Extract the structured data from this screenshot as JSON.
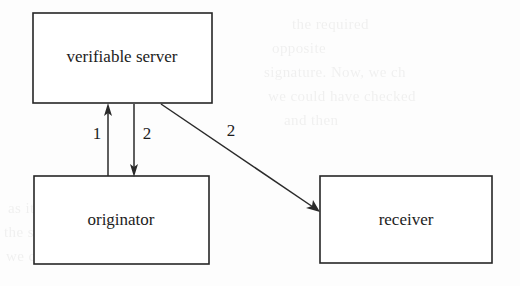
{
  "diagram": {
    "type": "node-edge-diagram",
    "canvas": {
      "width": 520,
      "height": 286
    },
    "colors": {
      "background": "#fdfdfd",
      "box_stroke": "#262626",
      "box_fill": "#ffffff",
      "text": "#1c1c1c",
      "edge": "#2a2a2a"
    },
    "nodes": [
      {
        "id": "verifiable-server",
        "label": "verifiable server",
        "x": 33,
        "y": 13,
        "width": 179,
        "height": 90,
        "label_x": 122,
        "label_y": 58
      },
      {
        "id": "originator",
        "label": "originator",
        "x": 34,
        "y": 176,
        "width": 175,
        "height": 88,
        "label_x": 121,
        "label_y": 221
      },
      {
        "id": "receiver",
        "label": "receiver",
        "x": 320,
        "y": 176,
        "width": 172,
        "height": 87,
        "label_x": 406,
        "label_y": 221
      }
    ],
    "edges": [
      {
        "id": "edge-originator-to-server",
        "label": "1",
        "from": "originator",
        "to": "verifiable-server",
        "direction": "up",
        "x1": 108,
        "y1": 176,
        "x2": 108,
        "y2": 104,
        "label_x": 97,
        "label_y": 135
      },
      {
        "id": "edge-server-to-originator",
        "label": "2",
        "from": "verifiable-server",
        "to": "originator",
        "direction": "down",
        "x1": 134,
        "y1": 104,
        "x2": 134,
        "y2": 176,
        "label_x": 147,
        "label_y": 135
      },
      {
        "id": "edge-server-to-receiver",
        "label": "2",
        "from": "verifiable-server",
        "to": "receiver",
        "direction": "diagonal-down-right",
        "x1": 161,
        "y1": 104,
        "x2": 319,
        "y2": 211,
        "label_x": 231,
        "label_y": 132
      }
    ],
    "background_bleed": [
      {
        "text": "the required",
        "x": 292,
        "y": 12
      },
      {
        "text": "opposite",
        "x": 272,
        "y": 36
      },
      {
        "text": "signature. Now, we ch",
        "x": 264,
        "y": 60
      },
      {
        "text": "we could have checked",
        "x": 268,
        "y": 84
      },
      {
        "text": "and then",
        "x": 284,
        "y": 108
      },
      {
        "text": "as it is",
        "x": 8,
        "y": 196
      },
      {
        "text": "the signature",
        "x": 4,
        "y": 220
      },
      {
        "text": "we can compute",
        "x": 6,
        "y": 244
      }
    ]
  }
}
